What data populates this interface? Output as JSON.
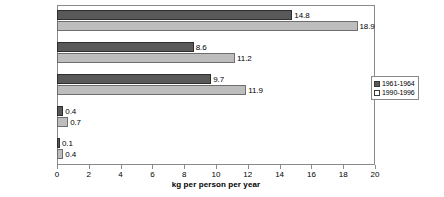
{
  "chart_data": {
    "type": "bar",
    "orientation": "horizontal",
    "title": "",
    "xlabel": "kg per person per year",
    "ylabel": "",
    "xlim": [
      0,
      20
    ],
    "xticks": [
      0,
      2,
      4,
      6,
      8,
      10,
      12,
      14,
      16,
      18,
      20
    ],
    "grid": false,
    "legend_position": "right",
    "categories": [
      "GREECE",
      "SPAIN",
      "ITALY",
      "FRANCE",
      "USA"
    ],
    "series": [
      {
        "name": "1961-1964",
        "color": "#595959",
        "values": [
          14.8,
          8.6,
          9.7,
          0.4,
          0.1
        ],
        "labels": [
          "14.8",
          "8.6",
          "9.7",
          "0.4",
          "0.1"
        ]
      },
      {
        "name": "1990-1996",
        "color": "#bdbdbd",
        "values": [
          18.9,
          11.2,
          11.9,
          0.7,
          0.4
        ],
        "labels": [
          "18.9",
          "11.2",
          "11.9",
          "0.7",
          "0.4"
        ]
      }
    ]
  }
}
